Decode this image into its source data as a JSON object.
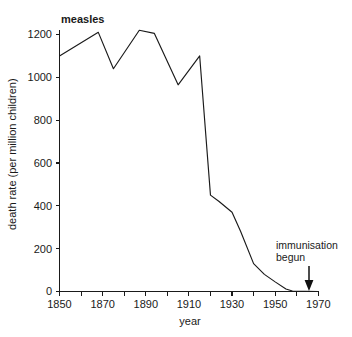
{
  "chart_data": {
    "type": "line",
    "title": "measles",
    "xlabel": "year",
    "ylabel": "death rate (per million children)",
    "xlim": [
      1850,
      1970
    ],
    "ylim": [
      0,
      1200
    ],
    "xticks": [
      1850,
      1870,
      1890,
      1910,
      1930,
      1950,
      1970
    ],
    "xtick_labels": [
      "1850",
      "1870",
      "1890",
      "1910",
      "1930",
      "1950",
      "1970"
    ],
    "minor_xtick_interval": 10,
    "yticks": [
      0,
      200,
      400,
      600,
      800,
      1000,
      1200
    ],
    "ytick_labels": [
      "0",
      "200",
      "400",
      "600",
      "800",
      "1000",
      "1200"
    ],
    "grid": false,
    "legend": false,
    "series": [
      {
        "name": "measles death rate",
        "color": "#1a1a1a",
        "x": [
          1850,
          1868,
          1875,
          1887,
          1894,
          1905,
          1915,
          1920,
          1924,
          1930,
          1934,
          1940,
          1945,
          1950,
          1955,
          1958,
          1970
        ],
        "y": [
          1100,
          1210,
          1040,
          1220,
          1205,
          965,
          1100,
          450,
          420,
          370,
          280,
          130,
          80,
          45,
          12,
          2,
          0
        ]
      }
    ],
    "annotations": [
      {
        "name": "immunisation-begun",
        "line1": "immunisation",
        "line2": "begun",
        "x": 1968,
        "arrow": "down",
        "arrow_target_y": 0
      }
    ]
  }
}
